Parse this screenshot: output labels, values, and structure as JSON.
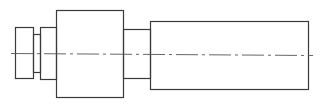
{
  "diagram": {
    "type": "shaft-side-view",
    "stroke_color": "#3a3a3a",
    "centerline_color": "#555555",
    "background": "#ffffff",
    "segments": [
      {
        "name": "end-collar",
        "x": 15,
        "y": 27,
        "w": 18,
        "h": 51
      },
      {
        "name": "groove-neck",
        "x": 33,
        "y": 34,
        "w": 7,
        "h": 38
      },
      {
        "name": "second-collar",
        "x": 40,
        "y": 27,
        "w": 16,
        "h": 52
      },
      {
        "name": "main-block",
        "x": 56,
        "y": 10,
        "w": 67,
        "h": 87
      },
      {
        "name": "shaft-neck",
        "x": 123,
        "y": 29,
        "w": 27,
        "h": 49
      },
      {
        "name": "long-shaft",
        "x": 150,
        "y": 21,
        "w": 158,
        "h": 68
      }
    ],
    "centerline": {
      "x1": 11,
      "y1": 53,
      "x2": 313,
      "y2": 55,
      "dash": "22 4 3 4"
    }
  }
}
